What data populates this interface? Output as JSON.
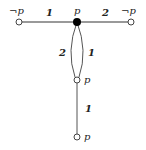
{
  "diagram": {
    "nodes": [
      {
        "id": "left",
        "label": "¬p",
        "filled": false
      },
      {
        "id": "center",
        "label": "p",
        "filled": true
      },
      {
        "id": "right",
        "label": "¬p",
        "filled": false
      },
      {
        "id": "middle",
        "label": "p",
        "filled": false
      },
      {
        "id": "bottom",
        "label": "p",
        "filled": false
      }
    ],
    "edges": [
      {
        "from": "left",
        "to": "center",
        "weight": "1"
      },
      {
        "from": "center",
        "to": "right",
        "weight": "2"
      },
      {
        "from": "center",
        "to": "middle",
        "weight": "2",
        "side": "left"
      },
      {
        "from": "center",
        "to": "middle",
        "weight": "1",
        "side": "right"
      },
      {
        "from": "middle",
        "to": "bottom",
        "weight": "1"
      }
    ]
  }
}
